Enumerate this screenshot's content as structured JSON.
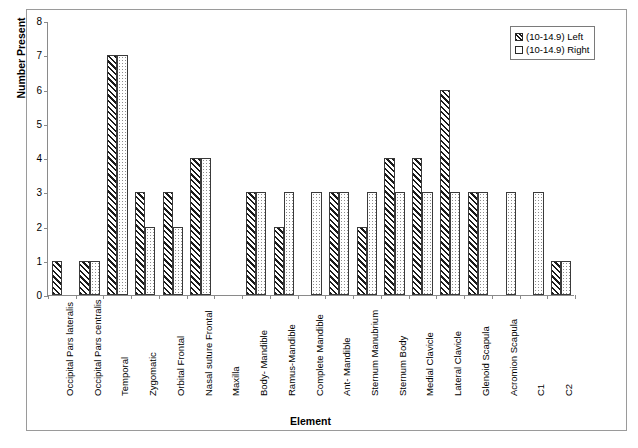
{
  "chart_data": {
    "type": "bar",
    "title": "",
    "xlabel": "Element",
    "ylabel": "Number Present",
    "ylim": [
      0,
      8
    ],
    "yticks": [
      0,
      1,
      2,
      3,
      4,
      5,
      6,
      7,
      8
    ],
    "grid": false,
    "legend_position": "top-right",
    "categories": [
      "Occipital Pars lateralis",
      "Occipital Pars centralis",
      "Temporal",
      "Zygomatic",
      "Orbital Frontal",
      "Nasal suture Frontal",
      "Maxilla",
      "Body- Mandible",
      "Ramus-Mandible",
      "Complete Mandible",
      "Ant- Mandible",
      "Sternum Manubrium",
      "Sternum Body",
      "Medial Clavicle",
      "Lateral Clavicle",
      "Glenoid Scapula",
      "Acromion Scapula",
      "C1",
      "C2"
    ],
    "series": [
      {
        "name": "(10-14.9) Left",
        "pattern": "diagonal-hatch",
        "values": [
          1,
          1,
          7,
          3,
          3,
          4,
          0,
          3,
          2,
          0,
          3,
          2,
          4,
          4,
          6,
          3,
          0,
          0,
          1
        ]
      },
      {
        "name": "(10-14.9) Right",
        "pattern": "dots",
        "values": [
          0,
          1,
          7,
          2,
          2,
          4,
          0,
          3,
          3,
          3,
          3,
          3,
          3,
          3,
          3,
          3,
          3,
          3,
          1
        ]
      }
    ]
  },
  "legend": {
    "items": [
      {
        "label": "(10-14.9) Left",
        "swatch": "hatch-swatch"
      },
      {
        "label": "(10-14.9) Right",
        "swatch": "dot-swatch"
      }
    ]
  },
  "axes": {
    "y_title": "Number Present",
    "x_title": "Element",
    "y_tick_labels": [
      "0",
      "1",
      "2",
      "3",
      "4",
      "5",
      "6",
      "7",
      "8"
    ]
  }
}
